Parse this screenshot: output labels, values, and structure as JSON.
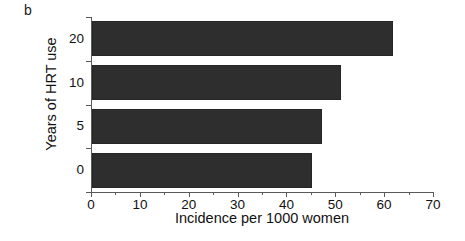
{
  "figure": {
    "panel_label": "b"
  },
  "chart_data": {
    "type": "bar",
    "orientation": "horizontal",
    "title": "",
    "xlabel": "Incidence per 1000 women",
    "ylabel": "Years of HRT use",
    "categories": [
      "0",
      "5",
      "10",
      "20"
    ],
    "values": [
      45,
      47,
      51,
      61.5
    ],
    "series": [
      {
        "name": "Incidence per 1000 women",
        "values": [
          45,
          47,
          51,
          61.5
        ]
      }
    ],
    "bars": [
      {
        "category": "20",
        "value": 61.5
      },
      {
        "category": "10",
        "value": 51
      },
      {
        "category": "5",
        "value": 47
      },
      {
        "category": "0",
        "value": 45
      }
    ],
    "xlim": [
      0,
      70
    ],
    "xticks": [
      0,
      10,
      20,
      30,
      40,
      50,
      60,
      70
    ],
    "xtick_labels": [
      "0",
      "10",
      "20",
      "30",
      "40",
      "50",
      "60",
      "70"
    ],
    "x_minor_ticks": [
      5,
      15,
      25,
      35,
      45,
      55,
      65
    ],
    "ytick_labels": [
      "20",
      "10",
      "5",
      "0"
    ],
    "grid": false,
    "legend": false,
    "bar_color": "#2e2e2e",
    "axis_color": "#5a5a5a",
    "background": "#ffffff"
  }
}
